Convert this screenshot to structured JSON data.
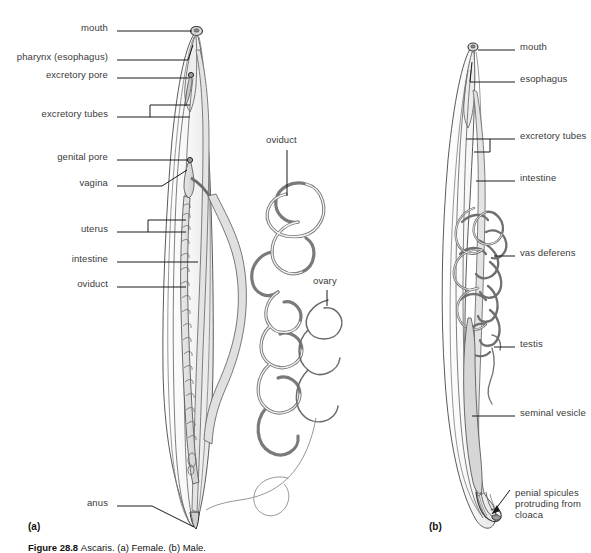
{
  "figure": {
    "caption_number": "Figure 28.8",
    "caption_text": "Ascaris. (a) Female. (b) Male.",
    "panel_a_tag": "(a)",
    "panel_b_tag": "(b)"
  },
  "colors": {
    "outline": "#5a5a5a",
    "outline_dark": "#2b2b2b",
    "fill_light": "#f2f2f2",
    "fill_mid": "#e2e2e2",
    "fill_shade": "#d2d2d2",
    "leader_line": "#1a1a1a",
    "label_text": "#3a3a3a",
    "background": "#ffffff"
  },
  "panel_a": {
    "title": "Female Ascaris",
    "labels": [
      {
        "id": "mouth",
        "text": "mouth",
        "x": 112,
        "y": 27,
        "leader": "line"
      },
      {
        "id": "pharynx",
        "text": "pharynx (esophagus)",
        "x": 112,
        "y": 56,
        "leader": "line"
      },
      {
        "id": "excretory-pore",
        "text": "excretory pore",
        "x": 112,
        "y": 74,
        "leader": "line"
      },
      {
        "id": "excretory-tubes",
        "text": "excretory tubes",
        "x": 112,
        "y": 113,
        "leader": "bracket"
      },
      {
        "id": "genital-pore",
        "text": "genital pore",
        "x": 112,
        "y": 156,
        "leader": "line"
      },
      {
        "id": "vagina",
        "text": "vagina",
        "x": 112,
        "y": 182,
        "leader": "line"
      },
      {
        "id": "uterus",
        "text": "uterus",
        "x": 112,
        "y": 228,
        "leader": "bracket"
      },
      {
        "id": "intestine",
        "text": "intestine",
        "x": 112,
        "y": 258,
        "leader": "line"
      },
      {
        "id": "oviduct-left",
        "text": "oviduct",
        "x": 112,
        "y": 283,
        "leader": "line"
      },
      {
        "id": "anus",
        "text": "anus",
        "x": 112,
        "y": 502,
        "leader": "line"
      },
      {
        "id": "oviduct-right",
        "text": "oviduct",
        "x": 266,
        "y": 139,
        "leader": "line",
        "align": "left"
      },
      {
        "id": "ovary",
        "text": "ovary",
        "x": 316,
        "y": 280,
        "leader": "line",
        "align": "left"
      }
    ]
  },
  "panel_b": {
    "title": "Male Ascaris",
    "labels": [
      {
        "id": "mouth",
        "text": "mouth",
        "x": 520,
        "y": 46,
        "leader": "line"
      },
      {
        "id": "esophagus",
        "text": "esophagus",
        "x": 520,
        "y": 78,
        "leader": "line"
      },
      {
        "id": "excretory-tubes",
        "text": "excretory tubes",
        "x": 520,
        "y": 135,
        "leader": "bracket"
      },
      {
        "id": "intestine",
        "text": "intestine",
        "x": 520,
        "y": 177,
        "leader": "line"
      },
      {
        "id": "vas-deferens",
        "text": "vas deferens",
        "x": 520,
        "y": 252,
        "leader": "line"
      },
      {
        "id": "testis",
        "text": "testis",
        "x": 520,
        "y": 343,
        "leader": "line"
      },
      {
        "id": "seminal-vesicle",
        "text": "seminal vesicle",
        "x": 520,
        "y": 412,
        "leader": "line"
      },
      {
        "id": "penial-spicules",
        "text": "penial spicules protruding from cloaca",
        "x": 510,
        "y": 492,
        "leader": "arrow",
        "multiline": true
      }
    ]
  }
}
